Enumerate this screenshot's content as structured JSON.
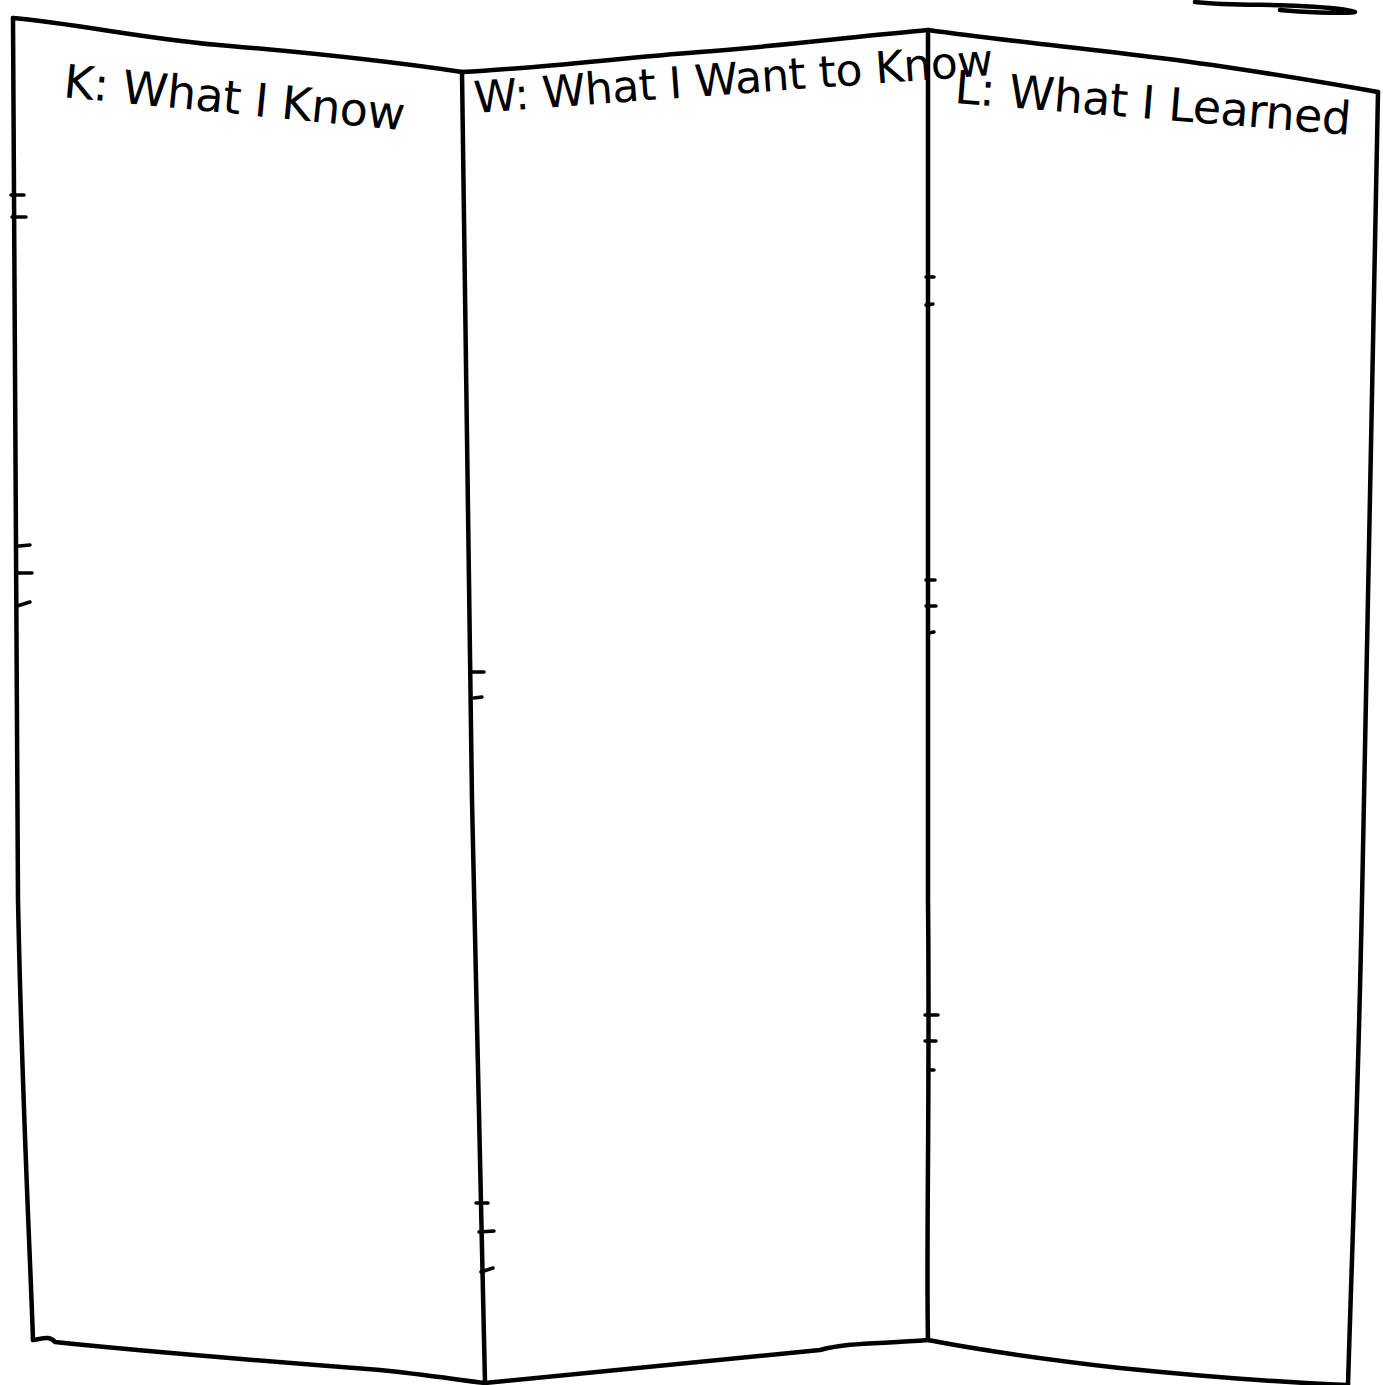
{
  "chart": {
    "type": "KWL chart",
    "style": "hand-drawn tri-fold board",
    "colors": {
      "ink": "#000000",
      "paper": "#ffffff"
    },
    "panels": [
      {
        "id": "k",
        "title": "K: What I Know",
        "content": ""
      },
      {
        "id": "w",
        "title": "W: What I Want to Know",
        "content": ""
      },
      {
        "id": "l",
        "title": "L: What I Learned",
        "content": ""
      }
    ]
  }
}
